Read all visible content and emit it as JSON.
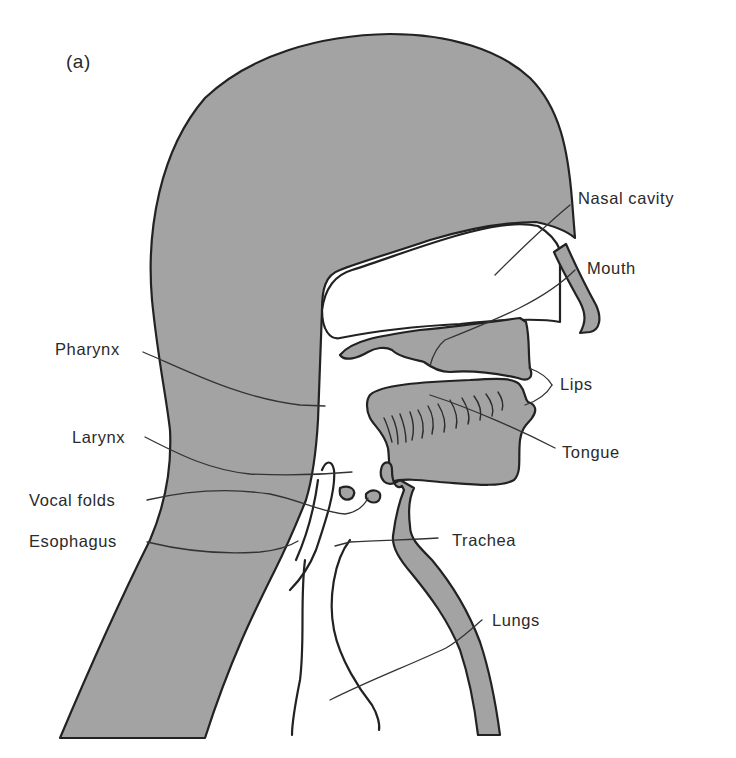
{
  "figure": {
    "panel_label": "(a)",
    "colors": {
      "tissue_fill": "#a3a3a3",
      "outline": "#222222",
      "background": "#ffffff"
    },
    "labels": [
      {
        "id": "nasal-cavity",
        "text": "Nasal cavity",
        "side": "right"
      },
      {
        "id": "mouth",
        "text": "Mouth",
        "side": "right"
      },
      {
        "id": "lips",
        "text": "Lips",
        "side": "right"
      },
      {
        "id": "tongue",
        "text": "Tongue",
        "side": "right"
      },
      {
        "id": "trachea",
        "text": "Trachea",
        "side": "right"
      },
      {
        "id": "lungs",
        "text": "Lungs",
        "side": "right"
      },
      {
        "id": "pharynx",
        "text": "Pharynx",
        "side": "left"
      },
      {
        "id": "larynx",
        "text": "Larynx",
        "side": "left"
      },
      {
        "id": "vocal-folds",
        "text": "Vocal folds",
        "side": "left"
      },
      {
        "id": "esophagus",
        "text": "Esophagus",
        "side": "left"
      }
    ]
  }
}
